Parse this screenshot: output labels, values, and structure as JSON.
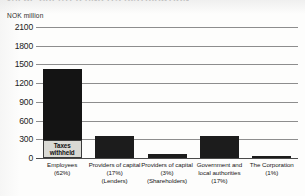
{
  "chart_title": "VALUE CREATED AND ITS DISTRIBUTION",
  "axis_unit": "NOK million",
  "colors": {
    "bar_dark": "#141414",
    "bar_light": "#d9d9d4",
    "gridline": "#8d8d8d",
    "axis": "#4a4a4a",
    "text": "#161616"
  },
  "annotations": {
    "taxes_withheld_line1": "Taxes",
    "taxes_withheld_line2": "withheld"
  },
  "chart_data": {
    "type": "bar",
    "title": "VALUE CREATED AND ITS DISTRIBUTION",
    "xlabel": "",
    "ylabel": "NOK million",
    "ylim": [
      0,
      2100
    ],
    "grid": true,
    "legend": "none",
    "yticks": [
      2100,
      1800,
      1500,
      1200,
      900,
      600,
      300,
      0
    ],
    "ytick_labels": [
      "2100",
      "1800",
      "1500",
      "1200",
      "900",
      "600",
      "300",
      "0"
    ],
    "categories": [
      "Employees (62%)",
      "Providers of capital (17%) (Lenders)",
      "Providers of capital (3%) (Shareholders)",
      "Government and local authorities (17%)",
      "The Corporation (1%)"
    ],
    "category_lines": [
      [
        "Employees",
        "(62%)"
      ],
      [
        "Providers of capital",
        "(17%)",
        "(Lenders)"
      ],
      [
        "Providers of capital",
        "(3%)",
        "(Shareholders)"
      ],
      [
        "Government and",
        "local authorities",
        "(17%)"
      ],
      [
        "The Corporation",
        "(1%)"
      ]
    ],
    "percentages": [
      62,
      17,
      3,
      17,
      1
    ],
    "values": [
      1420,
      355,
      60,
      355,
      40
    ],
    "stacked_segments": [
      {
        "category": "Employees (62%)",
        "total": 1420,
        "taxes_withheld": 290,
        "remainder": 1130
      }
    ],
    "annotations": [
      {
        "text": "Taxes withheld",
        "category": "Employees (62%)",
        "value_range": [
          0,
          290
        ]
      }
    ]
  }
}
